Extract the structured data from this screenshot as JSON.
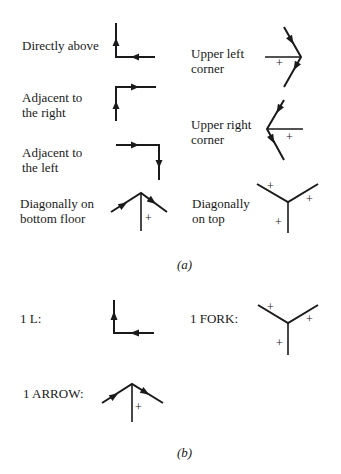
{
  "figure": {
    "part_a": {
      "caption": "(a)",
      "cases": [
        {
          "id": "directly-above",
          "label": "Directly above",
          "junction": "L"
        },
        {
          "id": "adjacent-right",
          "label": "Adjacent to\nthe right",
          "junction": "L"
        },
        {
          "id": "adjacent-left",
          "label": "Adjacent to\nthe left",
          "junction": "L"
        },
        {
          "id": "diagonal-bottom-floor",
          "label": "Diagonally on\nbottom floor",
          "junction": "ARROW"
        },
        {
          "id": "upper-left-corner",
          "label": "Upper left\ncorner",
          "junction": "ARROW"
        },
        {
          "id": "upper-right-corner",
          "label": "Upper right\ncorner",
          "junction": "ARROW"
        },
        {
          "id": "diagonal-on-top",
          "label": "Diagonally\non top",
          "junction": "FORK"
        }
      ]
    },
    "part_b": {
      "caption": "(b)",
      "items": [
        {
          "id": "l",
          "label": "1 L:"
        },
        {
          "id": "fork",
          "label": "1 FORK:"
        },
        {
          "id": "arrow",
          "label": "1 ARROW:"
        }
      ]
    },
    "marks": {
      "convex": "+"
    }
  }
}
